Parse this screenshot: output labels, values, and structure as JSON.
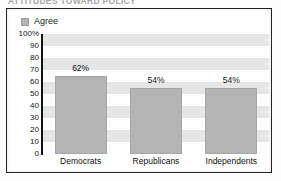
{
  "title_fragment": "ATTITUDES TOWARD POLICY",
  "legend": {
    "swatch_name": "agree-swatch",
    "label": "Agree",
    "color": "#b2b2b2"
  },
  "chart_data": {
    "type": "bar",
    "title": "",
    "xlabel": "",
    "ylabel": "",
    "categories": [
      "Democrats",
      "Republicans",
      "Independents"
    ],
    "series": [
      {
        "name": "Agree",
        "values": [
          62,
          54,
          54
        ],
        "labels": [
          "62%",
          "54%",
          "54%"
        ],
        "color": "#b4b4b4"
      }
    ],
    "ylim": [
      0,
      100
    ],
    "yticks": [
      0,
      10,
      20,
      30,
      40,
      50,
      60,
      70,
      80,
      90,
      100
    ],
    "ytick_labels": [
      "0",
      "10",
      "20",
      "30",
      "40",
      "50",
      "60",
      "70",
      "80",
      "90",
      "100%"
    ],
    "grid": false,
    "banded_background": true,
    "band_color": "#e6e6e6",
    "band_interval": 10,
    "legend_position": "top-left",
    "bar_draw_heights": [
      65,
      55,
      55
    ]
  },
  "colors": {
    "frame": "#222222",
    "page": "#ffffff",
    "text": "#111111",
    "bar": "#b4b4b4",
    "band": "#e6e6e6"
  }
}
